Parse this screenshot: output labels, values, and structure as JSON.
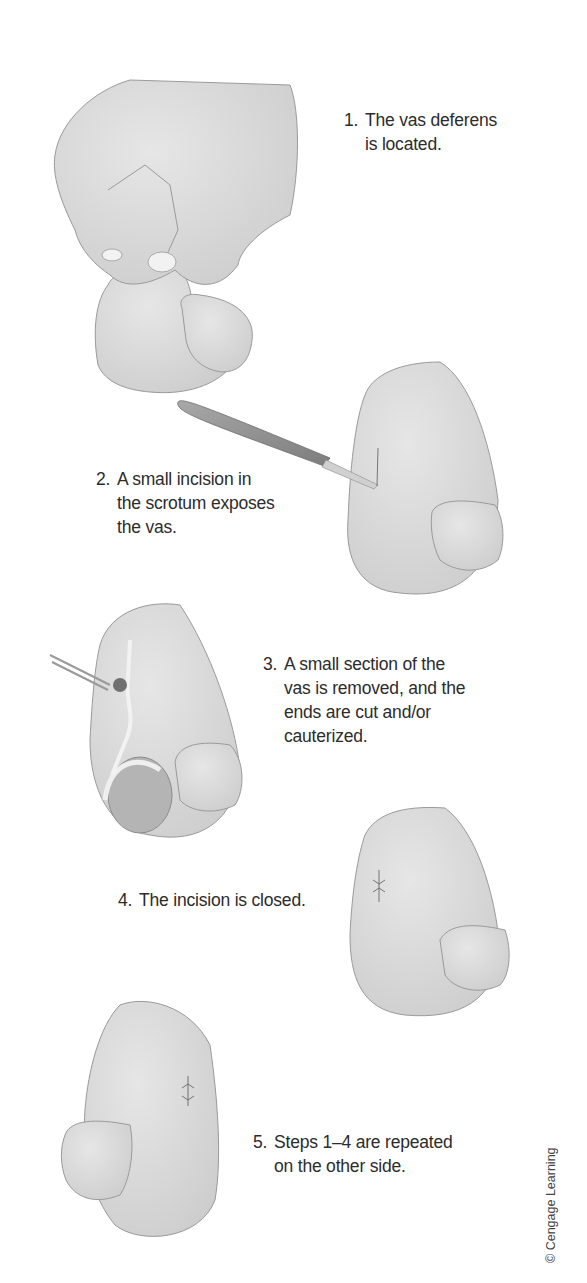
{
  "figure": {
    "steps": [
      {
        "number": "1.",
        "text": "The vas deferens\nis located.",
        "illustration": "hand-pinching-scrotum"
      },
      {
        "number": "2.",
        "text": "A small incision in\nthe scrotum exposes\nthe vas.",
        "illustration": "scalpel-incision"
      },
      {
        "number": "3.",
        "text": "A small section of the\nvas is removed, and the\nends are cut and/or\ncauterized.",
        "illustration": "forceps-vas-section"
      },
      {
        "number": "4.",
        "text": "The incision is closed.",
        "illustration": "sutured-incision"
      },
      {
        "number": "5.",
        "text": "Steps 1–4 are repeated\non the other side.",
        "illustration": "opposite-side-sutured"
      }
    ],
    "credit": "© Cengage Learning",
    "colors": {
      "skin_fill": "#d9d9d9",
      "outline": "#9a9a9a",
      "text": "#2c2c2c",
      "background": "#ffffff"
    }
  }
}
